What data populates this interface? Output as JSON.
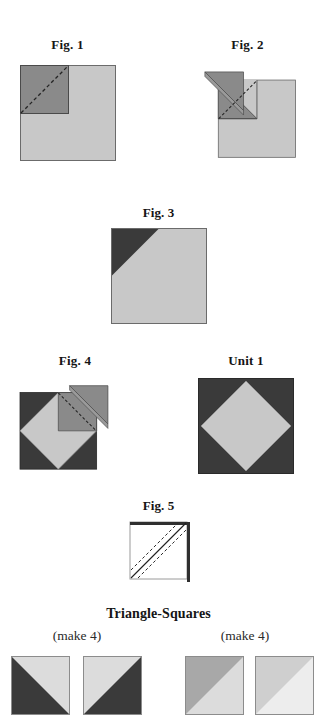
{
  "page": {
    "background": "#ffffff",
    "width": 317,
    "height": 691
  },
  "palette": {
    "dark": "#3a3a3a",
    "medium": "#8a8a8a",
    "light": "#c8c8c8",
    "pale": "#dcdcdc",
    "white": "#ffffff",
    "outline": "#5a5a5a",
    "stitch": "#2b2b2b",
    "text": "#151515"
  },
  "figures": [
    {
      "id": "fig-1",
      "label": "Fig. 1",
      "description": "Light background square with medium-gray square placed on the top-left quadrant and a dashed stitching line across its diagonal."
    },
    {
      "id": "fig-2",
      "label": "Fig. 2",
      "description": "The medium-gray triangle folded back open to the upper left along the stitched diagonal."
    },
    {
      "id": "fig-3",
      "label": "Fig. 3",
      "description": "Completed unit: light square with a dark triangle in the top-left corner."
    },
    {
      "id": "fig-4",
      "label": "Fig. 4",
      "description": "Dark square with light diamond; a medium-gray square folded back at the upper right with dashed stitching line."
    },
    {
      "id": "fig-5",
      "label": "Fig. 5",
      "description": "White square with a solid drawn diagonal and dashed seam lines on either side."
    }
  ],
  "unit": {
    "id": "unit-1",
    "label": "Unit 1",
    "description": "Square-in-a-square block: dark square with a centered light diamond."
  },
  "triangle_squares": {
    "title": "Triangle-Squares",
    "groups": [
      {
        "id": "group-left",
        "make_label": "(make 4)",
        "swatches": [
          {
            "id": "ts-dark-a",
            "fill": "#3a3a3a",
            "second": "#dcdcdc",
            "orientation": "lower-left"
          },
          {
            "id": "ts-dark-b",
            "fill": "#3a3a3a",
            "second": "#dcdcdc",
            "orientation": "lower-right"
          }
        ]
      },
      {
        "id": "group-right",
        "make_label": "(make 4)",
        "swatches": [
          {
            "id": "ts-medium-a",
            "fill": "#a8a8a8",
            "second": "#dcdcdc",
            "orientation": "upper-left"
          },
          {
            "id": "ts-medium-b",
            "fill": "#cfcfcf",
            "second": "#ededed",
            "orientation": "upper-left"
          }
        ]
      }
    ]
  }
}
